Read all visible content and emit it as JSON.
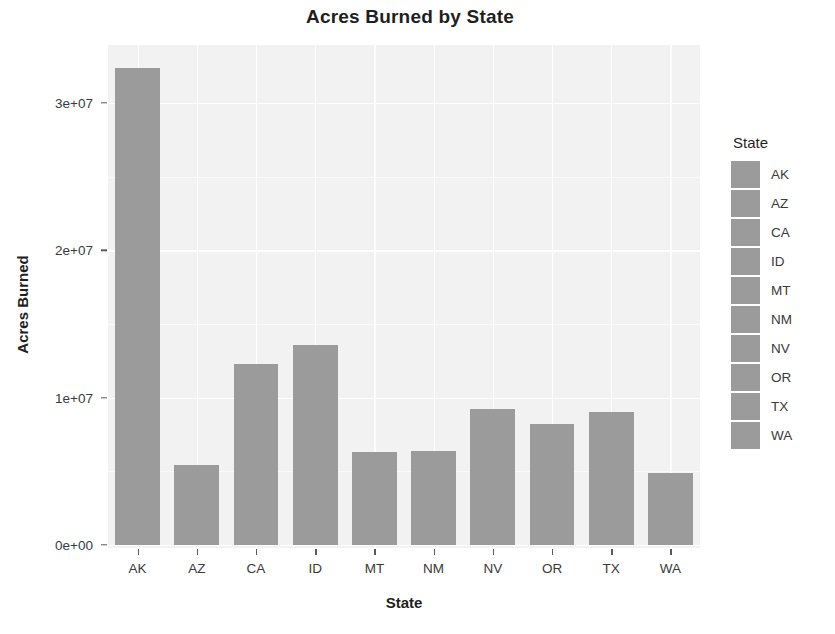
{
  "chart_data": {
    "type": "bar",
    "title": "Acres Burned by State",
    "xlabel": "State",
    "ylabel": "Acres Burned",
    "categories": [
      "AK",
      "AZ",
      "CA",
      "ID",
      "MT",
      "NM",
      "NV",
      "OR",
      "TX",
      "WA"
    ],
    "values": [
      32400000,
      5400000,
      12300000,
      13600000,
      6300000,
      6400000,
      9200000,
      8200000,
      9000000,
      4900000
    ],
    "ylim": [
      0,
      34000000
    ],
    "ytick_values": [
      0,
      10000000,
      20000000,
      30000000
    ],
    "ytick_labels": [
      "0e+00",
      "1e+07",
      "2e+07",
      "3e+07"
    ],
    "grid": true,
    "legend_position": "right",
    "legend_title": "State",
    "legend_entries": [
      {
        "label": "AK",
        "color": "#9b9b9b"
      },
      {
        "label": "AZ",
        "color": "#9b9b9b"
      },
      {
        "label": "CA",
        "color": "#9b9b9b"
      },
      {
        "label": "ID",
        "color": "#9b9b9b"
      },
      {
        "label": "MT",
        "color": "#9b9b9b"
      },
      {
        "label": "NM",
        "color": "#9b9b9b"
      },
      {
        "label": "NV",
        "color": "#9b9b9b"
      },
      {
        "label": "OR",
        "color": "#9b9b9b"
      },
      {
        "label": "TX",
        "color": "#9b9b9b"
      },
      {
        "label": "WA",
        "color": "#9b9b9b"
      }
    ],
    "bar_color": "#9b9b9b",
    "panel_background": "#f2f2f2",
    "gridline_color": "#ffffff",
    "plot_background": "#ffffff"
  }
}
